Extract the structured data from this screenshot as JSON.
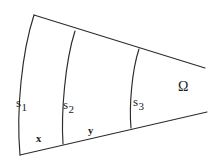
{
  "figure": {
    "kind": "geometry-diagram",
    "background_color": "#ffffff",
    "stroke_color": "#2b2b2b"
  },
  "labels": {
    "arc1": {
      "base": "s",
      "subscript": "1"
    },
    "arc2": {
      "base": "s",
      "subscript": "2"
    },
    "arc3": {
      "base": "s",
      "subscript": "3"
    },
    "point_x": "x",
    "point_y": "y",
    "region": "Ω"
  },
  "geometry": {
    "top_ray": {
      "from": [
        34,
        15
      ],
      "to": [
        205,
        68
      ]
    },
    "bottom_ray": {
      "from": [
        20,
        155
      ],
      "to": [
        207,
        112
      ]
    },
    "arcs": [
      {
        "name": "s1",
        "start": [
          34,
          15
        ],
        "end": [
          20,
          155
        ],
        "bulge": "left"
      },
      {
        "name": "s2",
        "start": [
          75,
          31
        ],
        "end": [
          63,
          144
        ],
        "bulge": "left"
      },
      {
        "name": "s3",
        "start": [
          139,
          49
        ],
        "end": [
          131,
          128
        ],
        "bulge": "left"
      }
    ]
  }
}
